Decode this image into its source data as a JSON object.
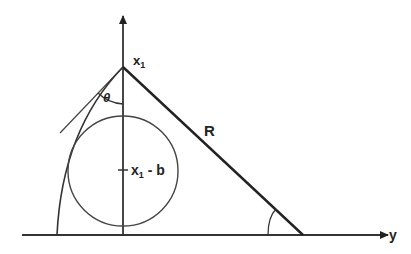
{
  "diagram": {
    "type": "geometry",
    "labels": {
      "apex": "x",
      "apex_sub": "1",
      "hypotenuse": "R",
      "center_main": "x",
      "center_sub": "1",
      "center_rest": " - b",
      "angle": "θ",
      "horizontal_axis": "y"
    },
    "colors": {
      "stroke": "#333333",
      "background": "#ffffff"
    }
  }
}
